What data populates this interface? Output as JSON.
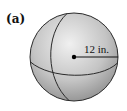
{
  "figure": {
    "part_label": "(a)",
    "shape": "sphere",
    "radius_label": "12 in.",
    "colors": {
      "sphere_light": "#ececec",
      "sphere_dark": "#9a9a9a",
      "outline": "#2a2a2a"
    }
  }
}
